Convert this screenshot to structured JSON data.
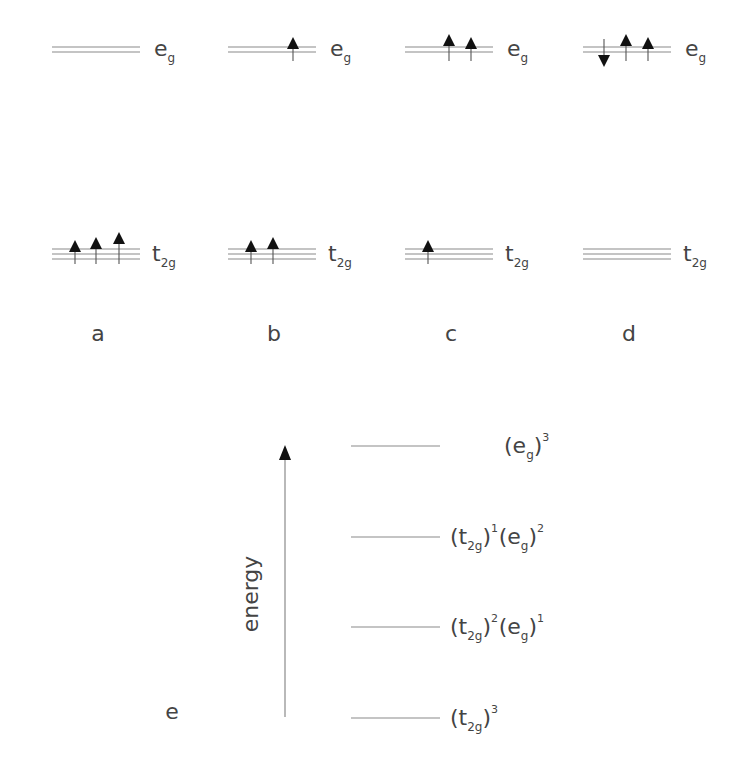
{
  "panels": [
    {
      "id": "a",
      "label": "a",
      "x": 52,
      "eg": {
        "symbol": "e",
        "sub": "g",
        "spins": []
      },
      "t2g": {
        "symbol": "t",
        "sub": "2g",
        "spins": [
          {
            "x": 75,
            "dir": "up",
            "dy": 0
          },
          {
            "x": 96,
            "dir": "up",
            "dy": -3
          },
          {
            "x": 119,
            "dir": "up",
            "dy": -8
          }
        ]
      }
    },
    {
      "id": "b",
      "label": "b",
      "x": 228,
      "eg": {
        "symbol": "e",
        "sub": "g",
        "spins": [
          {
            "x": 293,
            "dir": "up",
            "dy": 0
          }
        ]
      },
      "t2g": {
        "symbol": "t",
        "sub": "2g",
        "spins": [
          {
            "x": 251,
            "dir": "up",
            "dy": 0
          },
          {
            "x": 273,
            "dir": "up",
            "dy": -3
          }
        ]
      }
    },
    {
      "id": "c",
      "label": "c",
      "x": 405,
      "eg": {
        "symbol": "e",
        "sub": "g",
        "spins": [
          {
            "x": 449,
            "dir": "up",
            "dy": -3
          },
          {
            "x": 471,
            "dir": "up",
            "dy": 0
          }
        ]
      },
      "t2g": {
        "symbol": "t",
        "sub": "2g",
        "spins": [
          {
            "x": 428,
            "dir": "up",
            "dy": 0
          }
        ]
      }
    },
    {
      "id": "d",
      "label": "d",
      "x": 583,
      "eg": {
        "symbol": "e",
        "sub": "g",
        "spins": [
          {
            "x": 604,
            "dir": "down",
            "dy": 0
          },
          {
            "x": 626,
            "dir": "up",
            "dy": -3
          },
          {
            "x": 648,
            "dir": "up",
            "dy": 0
          }
        ]
      },
      "t2g": {
        "symbol": "t",
        "sub": "2g",
        "spins": []
      }
    }
  ],
  "energy_diagram": {
    "axis_label": "energy",
    "left_label": "e",
    "levels": [
      {
        "y": 446,
        "terms": [
          {
            "base": "(e",
            "sub": "g",
            "close": ")",
            "sup": "3"
          }
        ]
      },
      {
        "y": 537,
        "terms": [
          {
            "base": "(t",
            "sub": "2g",
            "close": ")",
            "sup": "1"
          },
          {
            "base": "(e",
            "sub": "g",
            "close": ")",
            "sup": "2"
          }
        ]
      },
      {
        "y": 627,
        "terms": [
          {
            "base": "(t",
            "sub": "2g",
            "close": ")",
            "sup": "2"
          },
          {
            "base": "(e",
            "sub": "g",
            "close": ")",
            "sup": "1"
          }
        ]
      },
      {
        "y": 718,
        "terms": [
          {
            "base": "(t",
            "sub": "2g",
            "close": ")",
            "sup": "3"
          }
        ]
      }
    ],
    "level_labels": [
      "(eg)3",
      "(t2g)1(eg)2",
      "(t2g)2(eg)1",
      "(t2g)3"
    ]
  }
}
